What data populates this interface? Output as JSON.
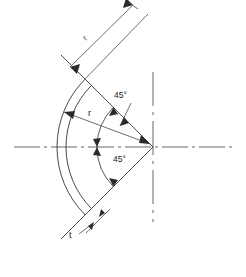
{
  "drawing": {
    "title": "Dished head cross-section with 45 degree half-angle",
    "background_color": "#ffffff",
    "line_color": "#3a3a3a",
    "centerline_color": "#555555",
    "text_color": "#1a1a1a",
    "width": 246,
    "height": 277,
    "labels": {
      "radius_outer": "r",
      "radius_inner": "r",
      "angle_upper": "45°",
      "angle_lower": "45°",
      "thickness": "t"
    },
    "geometry": {
      "apex_x": 153,
      "apex_y": 147,
      "arc_radius": 96,
      "half_angle_deg": 45,
      "thickness_px": 9
    },
    "elements": [
      "horizontal-centerline",
      "vertical-centerline",
      "outer-arc",
      "inner-arc",
      "upper-ray",
      "lower-ray",
      "outer-radius-dimension",
      "inner-radius-dimension",
      "upper-angle-arc",
      "lower-angle-arc",
      "thickness-dimension"
    ]
  }
}
